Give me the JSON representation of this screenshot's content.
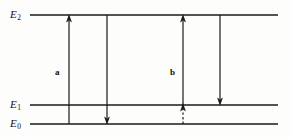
{
  "figure": {
    "type": "energy-level-diagram",
    "background_color": "#fdfdfc",
    "line_color": "#1a1a1a",
    "levels": [
      {
        "id": "E2",
        "symbol": "E",
        "subscript": "2",
        "y": 15,
        "x_start": 30,
        "x_end": 278
      },
      {
        "id": "E1",
        "symbol": "E",
        "subscript": "1",
        "y": 105,
        "x_start": 30,
        "x_end": 278
      },
      {
        "id": "E0",
        "symbol": "E",
        "subscript": "0",
        "y": 124,
        "x_start": 30,
        "x_end": 278
      }
    ],
    "level_labels": [
      {
        "for": "E2",
        "text": "E",
        "sub": "2",
        "x": 10,
        "y": 9
      },
      {
        "for": "E1",
        "text": "E",
        "sub": "1",
        "x": 10,
        "y": 99
      },
      {
        "for": "E0",
        "text": "E",
        "sub": "0",
        "x": 10,
        "y": 118
      }
    ],
    "transitions": [
      {
        "name": "absorption-up",
        "x": 69,
        "from_y": 124,
        "to_y": 15,
        "direction": "up",
        "style": "solid"
      },
      {
        "name": "emission-down-to-E0",
        "x": 107,
        "from_y": 15,
        "to_y": 124,
        "direction": "down",
        "style": "solid"
      },
      {
        "name": "pump-up-from-E1",
        "x": 183,
        "from_y": 105,
        "to_y": 15,
        "direction": "up",
        "style": "solid"
      },
      {
        "name": "relax-up-E0-to-E1",
        "x": 183,
        "from_y": 124,
        "to_y": 105,
        "direction": "up",
        "style": "dashed"
      },
      {
        "name": "emission-down-to-E1",
        "x": 220,
        "from_y": 15,
        "to_y": 105,
        "direction": "down",
        "style": "solid"
      }
    ],
    "transition_labels": [
      {
        "name": "label-a",
        "text": "a",
        "x": 55,
        "y": 68
      },
      {
        "name": "label-b",
        "text": "b",
        "x": 170,
        "y": 68
      }
    ]
  }
}
